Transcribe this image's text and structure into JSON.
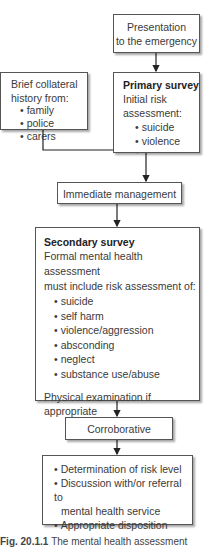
{
  "nodes": {
    "presentation": {
      "lines": [
        "Presentation",
        "to the emergency"
      ]
    },
    "collateral": {
      "title": "Brief collateral",
      "subtitle": "history from:",
      "items": [
        "family",
        "police",
        "carers"
      ]
    },
    "primary": {
      "title": "Primary survey",
      "line1": "Initial risk",
      "line2": "assessment:",
      "items": [
        "suicide",
        "violence"
      ]
    },
    "immediate": {
      "label": "Immediate management"
    },
    "secondary": {
      "title": "Secondary survey",
      "line1": "Formal mental health assessment",
      "line2": "must include risk assessment of:",
      "items": [
        "suicide",
        "self harm",
        "violence/aggression",
        "absconding",
        "neglect",
        "substance use/abuse"
      ],
      "footer": "Physical examination if appropriate"
    },
    "corroborative": {
      "label": "Corroborative"
    },
    "outcome": {
      "items": [
        "Determination of risk level",
        "Discussion with/or referral to",
        "mental health service",
        "Appropriate disposition"
      ]
    }
  },
  "caption": {
    "fig": "Fig. 20.1.1",
    "text": "The mental health assessment"
  }
}
